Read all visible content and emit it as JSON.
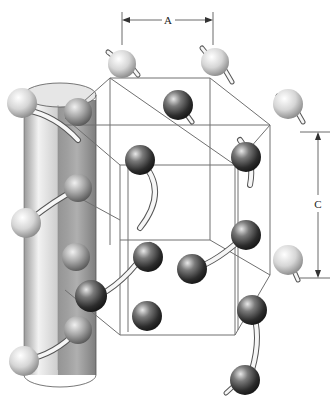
{
  "figure": {
    "labels": {
      "lattice_a": "A",
      "lattice_c": "C"
    },
    "colors": {
      "background": "#ffffff",
      "cylinder": "#c8c8c8",
      "cylinder_dark": "#8a8a8a",
      "atom_dark": "#3a3a3a",
      "atom_light": "#d8d8d8",
      "bond": "#f4f4f4",
      "lattice_line": "#777777"
    }
  }
}
